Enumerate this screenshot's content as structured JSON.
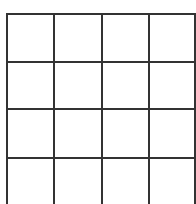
{
  "grid": {
    "rows": 4,
    "cols": 4,
    "line_color": "#333333",
    "background": "#ffffff",
    "vertical_lines_x": [
      6,
      53,
      101,
      148,
      194
    ],
    "horizontal_lines_y": [
      13,
      61,
      108,
      157
    ],
    "bottom_extends_past_edge": true,
    "cells": [
      [
        "",
        "",
        "",
        ""
      ],
      [
        "",
        "",
        "",
        ""
      ],
      [
        "",
        "",
        "",
        ""
      ],
      [
        "",
        "",
        "",
        ""
      ]
    ]
  }
}
